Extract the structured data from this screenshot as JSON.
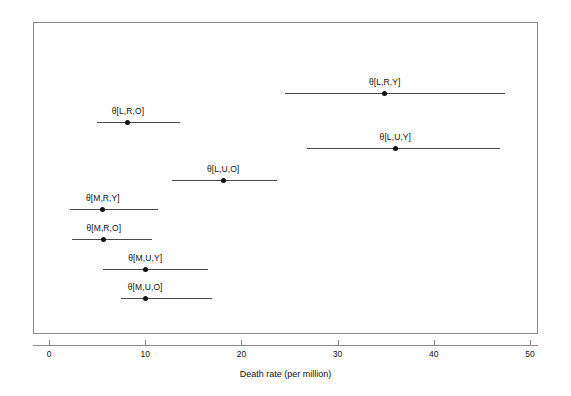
{
  "chart_data": {
    "type": "scatter",
    "title": "",
    "subtitle": "",
    "xlabel": "Death rate (per million)",
    "ylabel": "",
    "xlim": [
      0,
      52
    ],
    "ylim": [
      0,
      8
    ],
    "grid": false,
    "legend": false,
    "xticks": [
      0,
      10,
      20,
      30,
      40,
      50
    ],
    "xtick_labels": [
      "0",
      "10",
      "20",
      "30",
      "40",
      "50"
    ],
    "annotation_note": "Horizontal interval (credible interval) plot with point estimates",
    "series": [
      {
        "name": "theta[L,R,Y]",
        "label": "θ[L,R,Y]",
        "estimate": 34.9,
        "lower": 24.5,
        "upper": 47.4,
        "row": 0
      },
      {
        "name": "theta[L,U,Y]",
        "label": "θ[L,U,Y]",
        "estimate": 36.0,
        "lower": 26.8,
        "upper": 46.9,
        "row": 1
      },
      {
        "name": "theta[L,R,O]",
        "label": "θ[L,R,O]",
        "estimate": 8.2,
        "lower": 5.0,
        "upper": 13.6,
        "row": 2
      },
      {
        "name": "theta[L,U,O]",
        "label": "θ[L,U,O]",
        "estimate": 18.1,
        "lower": 12.8,
        "upper": 23.7,
        "row": 3
      },
      {
        "name": "theta[M,R,Y]",
        "label": "θ[M,R,Y]",
        "estimate": 5.6,
        "lower": 2.2,
        "upper": 11.3,
        "row": 4
      },
      {
        "name": "theta[M,R,O]",
        "label": "θ[M,R,O]",
        "estimate": 5.7,
        "lower": 2.4,
        "upper": 10.7,
        "row": 5
      },
      {
        "name": "theta[M,U,Y]",
        "label": "θ[M,U,Y]",
        "estimate": 10.0,
        "lower": 5.6,
        "upper": 16.5,
        "row": 6
      },
      {
        "name": "theta[M,U,O]",
        "label": "θ[M,U,O]",
        "estimate": 10.0,
        "lower": 7.5,
        "upper": 16.9,
        "row": 7
      }
    ],
    "colors": {
      "point": "#111111",
      "line": "#4a4a4a",
      "frame": "#888888",
      "background": "#ffffff",
      "text": "#111111"
    },
    "pixel_layout": {
      "frame": {
        "left": 33,
        "top": 22,
        "width": 505,
        "height": 312
      },
      "x_axis_px": {
        "x0": 49,
        "x50": 530
      },
      "row_y_px": [
        93,
        148,
        122,
        180,
        209,
        239,
        269,
        298
      ],
      "label_y_offset": -16
    }
  }
}
